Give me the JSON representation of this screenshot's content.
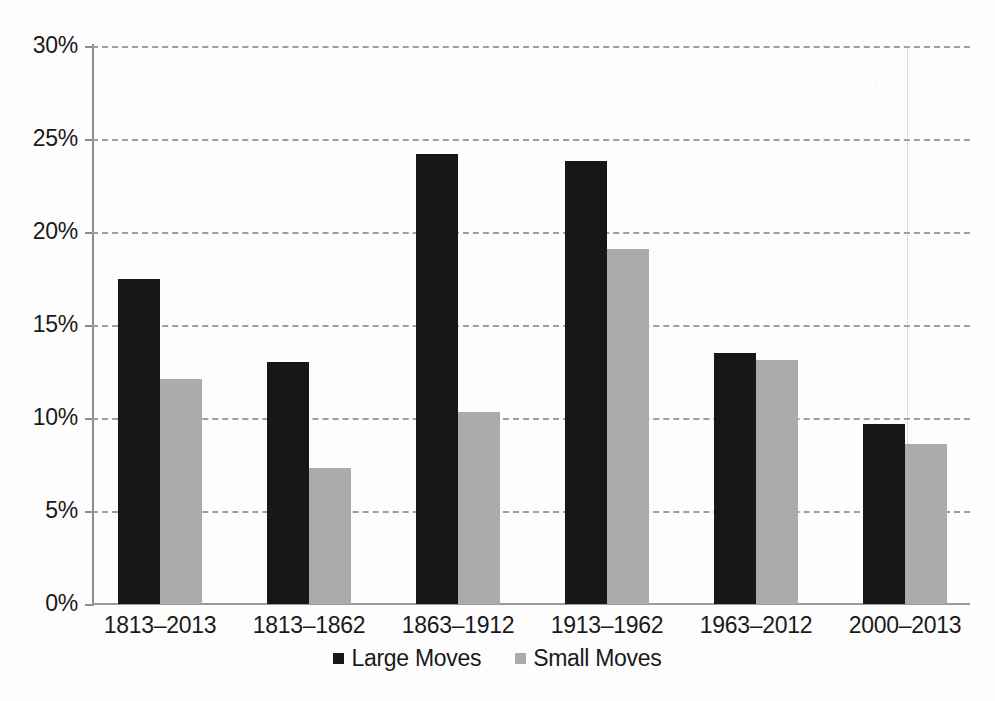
{
  "chart_data": {
    "type": "bar",
    "title": "",
    "subtitle": "",
    "xlabel": "",
    "ylabel": "",
    "categories": [
      "1813–2013",
      "1813–1862",
      "1863–1912",
      "1913–1962",
      "1963–2012",
      "2000–2013"
    ],
    "series": [
      {
        "name": "Large Moves",
        "color": "#171717",
        "values": [
          17.5,
          13.0,
          24.2,
          23.8,
          13.5,
          9.7
        ]
      },
      {
        "name": "Small Moves",
        "color": "#ababab",
        "values": [
          12.1,
          7.3,
          10.3,
          19.1,
          13.1,
          8.6
        ]
      }
    ],
    "ylim": [
      0,
      30
    ],
    "ytick_values": [
      30,
      25,
      20,
      15,
      10,
      5,
      0
    ],
    "ytick_labels": [
      "30%",
      "25%",
      "20%",
      "15%",
      "10%",
      "5%",
      "0%"
    ],
    "value_unit": "%",
    "grid": "horizontal-dashed",
    "legend_position": "bottom-center",
    "bar_mode": "grouped"
  },
  "legend": {
    "items": [
      {
        "label": "Large Moves",
        "marker": "square-filled-black"
      },
      {
        "label": "Small Moves",
        "marker": "square-filled-gray"
      }
    ]
  },
  "colors": {
    "background": "#fdfdfd",
    "large_moves": "#171717",
    "small_moves": "#ababab",
    "gridline": "#9e9e9e",
    "axis": "#8c8c8c",
    "text": "#1a1a1a"
  }
}
